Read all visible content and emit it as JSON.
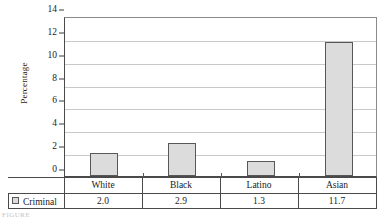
{
  "chart_data": {
    "type": "bar",
    "title": "",
    "xlabel": "",
    "ylabel": "Percentage",
    "categories": [
      "White",
      "Black",
      "Latino",
      "Asian"
    ],
    "series": [
      {
        "name": "Criminal",
        "values": [
          2.0,
          2.9,
          1.3,
          11.7
        ],
        "value_labels": [
          "2.0",
          "2.9",
          "1.3",
          "11.7"
        ],
        "color": "#dcdcdc",
        "border_color": "#585858"
      }
    ],
    "ylim": [
      0,
      14
    ],
    "yticks": [
      0,
      2,
      4,
      6,
      8,
      10,
      12,
      14
    ],
    "ytick_labels": [
      "0",
      "2",
      "4",
      "6",
      "8",
      "10",
      "12",
      "14"
    ],
    "grid": true,
    "grid_axis": "y",
    "legend_position": "bottom-table",
    "data_table_visible": true
  },
  "axis": {
    "y_title": "Percentage",
    "ticks": [
      {
        "value": 14,
        "label": "14"
      },
      {
        "value": 12,
        "label": "12"
      },
      {
        "value": 10,
        "label": "10"
      },
      {
        "value": 8,
        "label": "8"
      },
      {
        "value": 6,
        "label": "6"
      },
      {
        "value": 4,
        "label": "4"
      },
      {
        "value": 2,
        "label": "2"
      },
      {
        "value": 0,
        "label": "0"
      }
    ]
  },
  "table": {
    "legend_label": "Criminal",
    "legend_swatch_color": "#dcdcdc",
    "categories": [
      "White",
      "Black",
      "Latino",
      "Asian"
    ],
    "values": [
      "2.0",
      "2.9",
      "1.3",
      "11.7"
    ]
  },
  "caption": {
    "text": "FIGURE"
  }
}
